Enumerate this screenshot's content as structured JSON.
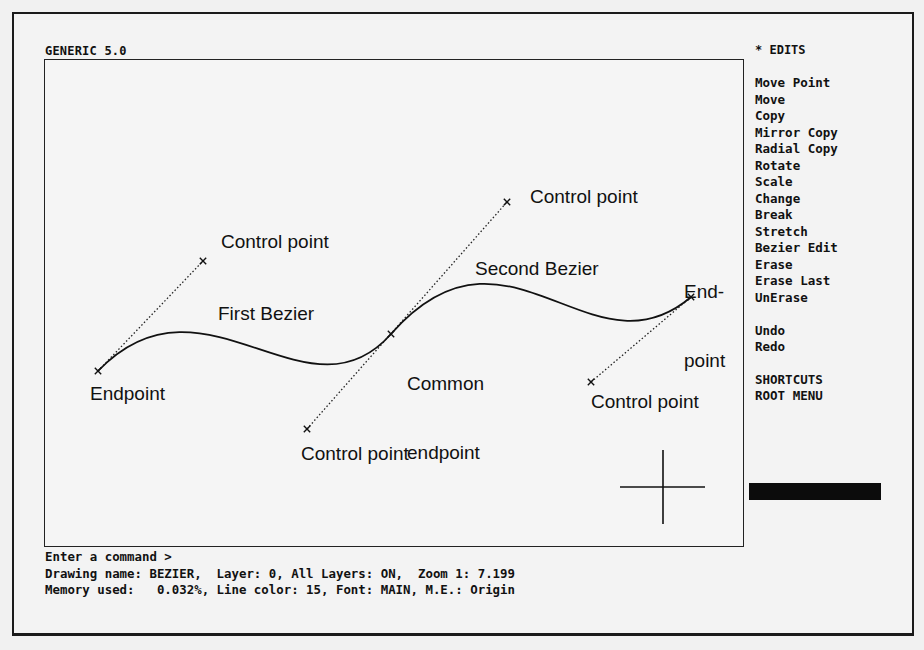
{
  "app": {
    "title": "GENERIC 5.0"
  },
  "menu": {
    "header": "* EDITS",
    "items": [
      {
        "label": "Move Point",
        "y": 0
      },
      {
        "label": "Move",
        "y": 16.5
      },
      {
        "label": "Copy",
        "y": 33
      },
      {
        "label": "Mirror Copy",
        "y": 49.5
      },
      {
        "label": "Radial Copy",
        "y": 66
      },
      {
        "label": "Rotate",
        "y": 82.5
      },
      {
        "label": "Scale",
        "y": 99
      },
      {
        "label": "Change",
        "y": 115.5
      },
      {
        "label": "Break",
        "y": 132
      },
      {
        "label": "Stretch",
        "y": 148.5
      },
      {
        "label": "Bezier Edit",
        "y": 165
      },
      {
        "label": "Erase",
        "y": 181.5
      },
      {
        "label": "Erase Last",
        "y": 198
      },
      {
        "label": "UnErase",
        "y": 214.5
      },
      {
        "label": "Undo",
        "y": 247.5
      },
      {
        "label": "Redo",
        "y": 264
      },
      {
        "label": "SHORTCUTS",
        "y": 296.5
      },
      {
        "label": "ROOT MENU",
        "y": 313
      }
    ]
  },
  "drawing": {
    "curves": [
      {
        "name": "First Bezier",
        "p0": [
          98,
          371
        ],
        "p1": [
          203,
          261
        ],
        "p2": [
          307,
          429
        ],
        "p3": [
          391,
          334
        ]
      },
      {
        "name": "Second Bezier",
        "p0": [
          391,
          334
        ],
        "p1": [
          507,
          202
        ],
        "p2": [
          591,
          382
        ],
        "p3": [
          691,
          297
        ]
      }
    ],
    "labels": {
      "control_point_1": "Control point",
      "first_bezier": "First Bezier",
      "endpoint_1": "Endpoint",
      "control_point_2": "Control point",
      "control_point_3": "Control point",
      "second_bezier": "Second Bezier",
      "common_endpoint_line1": "Common",
      "common_endpoint_line2": "endpoint",
      "endpoint_2_line1": "End-",
      "endpoint_2_line2": "point",
      "control_point_4": "Control point"
    },
    "cursor": {
      "x": 663,
      "y": 487
    }
  },
  "command_line": {
    "prompt": "Enter a command >",
    "status_line_1": "Drawing name: BEZIER,  Layer: 0, All Layers: ON,  Zoom 1: 7.199",
    "status_line_2": "Memory used:   0.032%, Line color: 15, Font: MAIN, M.E.: Origin"
  },
  "colors": {
    "background": "#f1f1f1",
    "ink": "#111111"
  }
}
